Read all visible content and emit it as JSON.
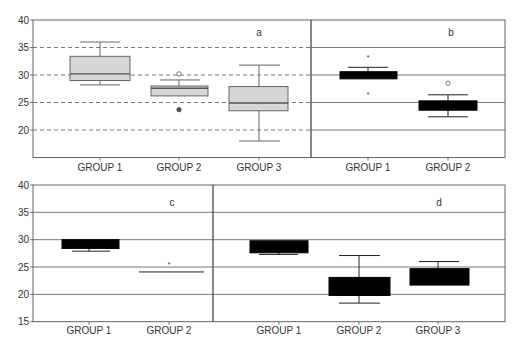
{
  "chart_data": [
    {
      "panel": "a",
      "type": "boxplot",
      "style": "gray-box-dashed-grid",
      "categories": [
        "GROUP 1",
        "GROUP 2",
        "GROUP 3"
      ],
      "ylim": [
        15,
        40
      ],
      "yticks": [
        20,
        25,
        30,
        35,
        40
      ],
      "grid": "dashed",
      "boxes": [
        {
          "name": "GROUP 1",
          "whisker_low": 28.2,
          "q1": 29.0,
          "median": 30.2,
          "q3": 33.4,
          "whisker_high": 36.0,
          "outliers": []
        },
        {
          "name": "GROUP 2",
          "whisker_low": 26.2,
          "q1": 26.2,
          "median": 27.6,
          "q3": 28.0,
          "whisker_high": 29.1,
          "outliers": [
            {
              "value": 30.2,
              "marker": "circle"
            },
            {
              "value": 23.7,
              "marker": "filled"
            }
          ]
        },
        {
          "name": "GROUP 3",
          "whisker_low": 18.0,
          "q1": 23.5,
          "median": 24.9,
          "q3": 27.9,
          "whisker_high": 31.8,
          "outliers": []
        }
      ]
    },
    {
      "panel": "b",
      "type": "boxplot",
      "style": "black-box-solid-grid",
      "categories": [
        "GROUP 1",
        "GROUP 2"
      ],
      "ylim": [
        15,
        40
      ],
      "yticks": [
        20,
        25,
        30,
        35,
        40
      ],
      "grid": "solid",
      "boxes": [
        {
          "name": "GROUP 1",
          "whisker_low": 29.3,
          "q1": 29.3,
          "median": 30.0,
          "q3": 30.6,
          "whisker_high": 31.4,
          "outliers": [
            {
              "value": 33.3,
              "marker": "star"
            },
            {
              "value": 26.6,
              "marker": "star"
            }
          ]
        },
        {
          "name": "GROUP 2",
          "whisker_low": 22.4,
          "q1": 23.6,
          "median": 24.5,
          "q3": 25.3,
          "whisker_high": 26.4,
          "outliers": [
            {
              "value": 28.5,
              "marker": "circle"
            }
          ]
        }
      ]
    },
    {
      "panel": "c",
      "type": "boxplot",
      "style": "black-box-solid-grid",
      "categories": [
        "GROUP 1",
        "GROUP 2"
      ],
      "ylim": [
        15,
        40
      ],
      "yticks": [
        15,
        20,
        25,
        30,
        35,
        40
      ],
      "grid": "solid",
      "boxes": [
        {
          "name": "GROUP 1",
          "whisker_low": 27.9,
          "q1": 28.4,
          "median": 29.2,
          "q3": 30.0,
          "whisker_high": 30.0,
          "outliers": []
        },
        {
          "name": "GROUP 2",
          "whisker_low": 24.1,
          "q1": 24.1,
          "median": 24.1,
          "q3": 24.1,
          "whisker_high": 24.1,
          "outliers": [
            {
              "value": 25.5,
              "marker": "star"
            }
          ]
        }
      ]
    },
    {
      "panel": "d",
      "type": "boxplot",
      "style": "black-box-solid-grid",
      "categories": [
        "GROUP 1",
        "GROUP 2",
        "GROUP 3"
      ],
      "ylim": [
        15,
        40
      ],
      "yticks": [
        15,
        20,
        25,
        30,
        35,
        40
      ],
      "grid": "solid",
      "boxes": [
        {
          "name": "GROUP 1",
          "whisker_low": 27.3,
          "q1": 27.6,
          "median": 28.8,
          "q3": 29.8,
          "whisker_high": 29.8,
          "outliers": []
        },
        {
          "name": "GROUP 2",
          "whisker_low": 18.4,
          "q1": 19.8,
          "median": 21.5,
          "q3": 23.1,
          "whisker_high": 27.1,
          "outliers": []
        },
        {
          "name": "GROUP 3",
          "whisker_low": 21.7,
          "q1": 21.7,
          "median": 23.2,
          "q3": 24.7,
          "whisker_high": 26.0,
          "outliers": []
        }
      ]
    }
  ],
  "layout": {
    "top": {
      "y_top_px": 20,
      "y_bottom_px": 157.5,
      "v_top": 40,
      "v_bottom": 15,
      "axis_left": 33,
      "panel_a": {
        "x0": 33,
        "x1": 311,
        "letter_x": 259,
        "letter_y": 36,
        "centers": [
          100,
          179,
          259
        ],
        "box_x": [
          [
            70,
            130
          ],
          [
            151,
            208
          ],
          [
            229,
            288
          ]
        ],
        "cap_x": [
          [
            80,
            120
          ],
          [
            160,
            200
          ],
          [
            239,
            280
          ]
        ]
      },
      "panel_b": {
        "x0": 311,
        "x1": 505,
        "letter_x": 451,
        "letter_y": 36,
        "centers": [
          368,
          448
        ],
        "box_x": [
          [
            340,
            397
          ],
          [
            419,
            477
          ]
        ],
        "cap_x": [
          [
            348,
            388
          ],
          [
            428,
            468
          ]
        ]
      },
      "labels_y": 171
    },
    "bottom": {
      "y_top_px": 185,
      "y_bottom_px": 321.7,
      "v_top": 40,
      "v_bottom": 15,
      "axis_left": 33,
      "panel_c": {
        "x0": 33,
        "x1": 213,
        "letter_x": 172,
        "letter_y": 206,
        "centers": [
          89,
          169
        ],
        "box_x": [
          [
            62,
            119
          ],
          [
            139,
            204
          ]
        ],
        "cap_x": [
          [
            72,
            110
          ],
          [
            139,
            204
          ]
        ]
      },
      "panel_d": {
        "x0": 213,
        "x1": 505,
        "letter_x": 439,
        "letter_y": 206,
        "centers": [
          279,
          359,
          438
        ],
        "box_x": [
          [
            250,
            308
          ],
          [
            329,
            390
          ],
          [
            410,
            469
          ]
        ],
        "cap_x": [
          [
            259,
            298
          ],
          [
            339,
            380
          ],
          [
            419,
            459
          ]
        ]
      },
      "labels_y": 334
    }
  },
  "colors": {
    "axis": "#555555",
    "grid": "#555555",
    "box_fill_gray": "#d6d6d6",
    "box_stroke_gray": "#666666",
    "box_fill_black": "#000000",
    "text": "#333333"
  }
}
